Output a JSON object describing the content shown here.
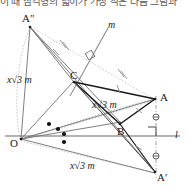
{
  "header": {
    "clipped_text": "이 때 삼각형의 넓이가 가장 작은 다음 그림과"
  },
  "figure": {
    "lines": {
      "line_m_label": "m",
      "line_l_label": "l"
    },
    "points": [
      {
        "id": "A2",
        "label": "A″",
        "x": 28,
        "y": 22
      },
      {
        "id": "C",
        "label": "C",
        "x": 73,
        "y": 80
      },
      {
        "id": "A",
        "label": "A",
        "x": 158,
        "y": 97
      },
      {
        "id": "B",
        "label": "B",
        "x": 120,
        "y": 126
      },
      {
        "id": "O",
        "label": "O",
        "x": 19,
        "y": 140
      },
      {
        "id": "Ap",
        "label": "A′",
        "x": 158,
        "y": 174
      }
    ],
    "length_labels": [
      {
        "id": "len-left",
        "text": "x√3 m",
        "x": 8,
        "y": 76
      },
      {
        "id": "len-center",
        "text": "x√3 m",
        "x": 95,
        "y": 101
      },
      {
        "id": "len-bottom",
        "text": "x√3 m",
        "x": 72,
        "y": 162
      }
    ],
    "marks": {
      "right_angle_on_m": "right-angle-mark",
      "right_angle_on_l": "right-angle-mark",
      "tick_marks": "equal-length-ticks",
      "angle_dots": "equal-angle-dots",
      "circle_ticks": "equal-segment-circles"
    },
    "colors": {
      "stroke_dark": "#1a1a1a",
      "stroke_mid": "#6b6b6b",
      "stroke_light": "#a9a9a9",
      "stroke_dotted": "#b5b5b5",
      "background": "#ffffff"
    }
  }
}
